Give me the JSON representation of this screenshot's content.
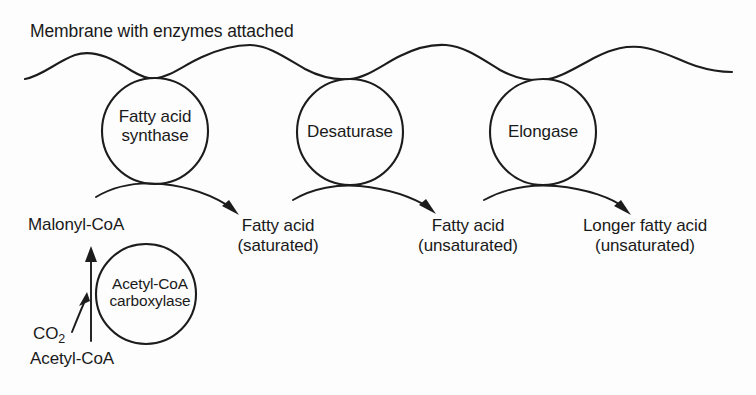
{
  "diagram": {
    "title": "Membrane with enzymes attached",
    "membrane": {
      "name": "membrane-wavy-line",
      "crest_positions_x": [
        75,
        245,
        400,
        630
      ],
      "trough_positions_x": [
        155,
        350,
        543
      ]
    },
    "membrane_enzymes": [
      {
        "id": "fatty-acid-synthase",
        "label_lines": [
          "Fatty acid",
          "synthase"
        ],
        "cx": 155,
        "cy": 131,
        "r": 53
      },
      {
        "id": "desaturase",
        "label_lines": [
          "Desaturase"
        ],
        "cx": 350,
        "cy": 132,
        "r": 53
      },
      {
        "id": "elongase",
        "label_lines": [
          "Elongase"
        ],
        "cx": 543,
        "cy": 132,
        "r": 53
      }
    ],
    "cytosolic_enzyme": {
      "id": "acetyl-coa-carboxylase",
      "label_lines": [
        "Acetyl-CoA",
        "carboxylase"
      ],
      "cx": 146,
      "cy": 294,
      "r": 50
    },
    "substrates": {
      "malonyl_coa": "Malonyl-CoA",
      "co2": "CO",
      "co2_subscript": "2",
      "acetyl_coa": "Acetyl-CoA"
    },
    "products": [
      {
        "id": "fatty-acid-saturated",
        "line1": "Fatty acid",
        "line2": "(saturated)",
        "center_x": 278
      },
      {
        "id": "fatty-acid-unsaturated",
        "line1": "Fatty acid",
        "line2": "(unsaturated)",
        "center_x": 468
      },
      {
        "id": "longer-fatty-acid-unsaturated",
        "line1": "Longer fatty acid",
        "line2": "(unsaturated)",
        "center_x": 645
      }
    ],
    "reaction_arrows": [
      {
        "id": "arrow-synthase-to-saturated",
        "from_x": 95,
        "to_x": 238
      },
      {
        "id": "arrow-desaturase-to-unsaturated",
        "from_x": 293,
        "to_x": 435
      },
      {
        "id": "arrow-elongase-to-longer",
        "from_x": 483,
        "to_x": 630
      },
      {
        "id": "arrow-acetylcoa-to-malonylcoa",
        "from_y": 340,
        "to_y": 250
      },
      {
        "id": "arrow-co2-entry",
        "from_x": 73,
        "to_x": 89
      }
    ],
    "colors": {
      "ink": "#1c1c1c",
      "background": "#fdfdfd"
    }
  }
}
